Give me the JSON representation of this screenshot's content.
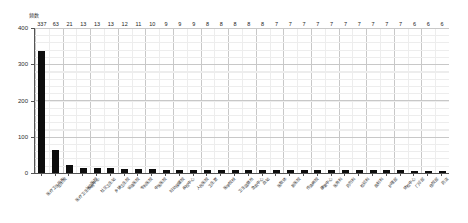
{
  "chart_data": {
    "type": "bar",
    "title": "",
    "subtitle": "",
    "xlabel": "",
    "ylabel": "频数",
    "ylim": [
      0,
      400
    ],
    "yticks": [
      0,
      100,
      200,
      300,
      400
    ],
    "grid": "major-and-minor",
    "legend": "none",
    "bar_color": "#0d0d0d",
    "grid_color": "#c8c8c8",
    "axis_color": "#555555",
    "background": "#ffffff",
    "categories": [
      "医疗卫生机构",
      "卫生院",
      "医疗卫生服务中心",
      "公立医院",
      "社区卫生站",
      "乡镇卫生院",
      "省级医院",
      "专科医院",
      "中医医院",
      "妇幼保健院",
      "疾控中心",
      "人民医院",
      "卫生室",
      "医学院校",
      "卫生监督所",
      "急救中心",
      "血站",
      "医联体",
      "新医院",
      "传染病院",
      "康复中心",
      "医务科",
      "药剂科",
      "检验科",
      "放射科",
      "护理部",
      "体检中心",
      "门诊部",
      "住院部",
      "药店"
    ],
    "values": [
      337,
      63,
      21,
      13,
      13,
      13,
      12,
      11,
      10,
      9,
      9,
      9,
      8,
      8,
      8,
      8,
      8,
      7,
      7,
      7,
      7,
      7,
      7,
      7,
      7,
      7,
      7,
      6,
      6,
      6
    ],
    "value_labels": [
      "337",
      "63",
      "21",
      "13",
      "13",
      "13",
      "12",
      "11",
      "10",
      "9",
      "9",
      "9",
      "8",
      "8",
      "8",
      "8",
      "8",
      "7",
      "7",
      "7",
      "7",
      "7",
      "7",
      "7",
      "7",
      "7",
      "7",
      "6",
      "6",
      "6"
    ],
    "ytick_labels": [
      "0",
      "100",
      "200",
      "300",
      "400"
    ]
  }
}
